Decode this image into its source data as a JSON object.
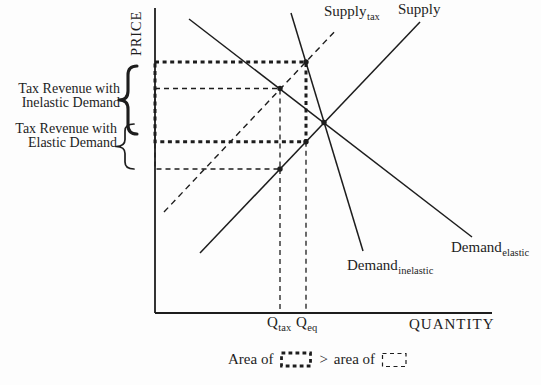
{
  "colors": {
    "ink": "#1d1d1d",
    "background": "#fdfdfd"
  },
  "labels": {
    "price_axis": "PRICE",
    "quantity_axis": "QUANTITY",
    "curves": {
      "supply_tax": {
        "base": "Supply",
        "sub": "tax"
      },
      "supply": {
        "base": "Supply",
        "sub": ""
      },
      "demand_inelastic": {
        "base": "Demand",
        "sub": "inelastic"
      },
      "demand_elastic": {
        "base": "Demand",
        "sub": "elastic"
      }
    },
    "x_ticks": {
      "q_tax": {
        "base": "Q",
        "sub": "tax"
      },
      "q_eq": {
        "base": "Q",
        "sub": "eq"
      }
    },
    "annotations": {
      "inelastic": {
        "line1": "Tax Revenue with",
        "line2": "Inelastic Demand"
      },
      "elastic": {
        "line1": "Tax Revenue with",
        "line2": "Elastic Demand"
      }
    },
    "legend": {
      "area_of": "Area of",
      "comparator": ">",
      "area_of_lower": "area of"
    }
  },
  "chart_data": {
    "type": "line",
    "xlabel": "QUANTITY",
    "ylabel": "PRICE",
    "x_ticks": [
      "Q_tax",
      "Q_eq"
    ],
    "grid": false,
    "legend_position": "bottom",
    "series": [
      {
        "id": "supply",
        "name": "Supply",
        "style": "solid",
        "sw": 1.5,
        "points_px": [
          [
            200,
            253
          ],
          [
            420,
            22
          ]
        ]
      },
      {
        "id": "supply-tax",
        "name": "Supply_tax",
        "style": "dashed",
        "dash": "6 4.5",
        "sw": 1.4,
        "points_px": [
          [
            164,
            212
          ],
          [
            337,
            29
          ]
        ]
      },
      {
        "id": "demand-inelastic",
        "name": "Demand_inelastic",
        "style": "solid",
        "sw": 1.5,
        "points_px": [
          [
            291,
            13
          ],
          [
            363,
            251
          ]
        ]
      },
      {
        "id": "demand-elastic",
        "name": "Demand_elastic",
        "style": "solid",
        "sw": 1.5,
        "points_px": [
          [
            189,
            19
          ],
          [
            472,
            237
          ]
        ]
      }
    ],
    "key_points_px": {
      "supply_tax_x_demand_inelastic": [
        306,
        62
      ],
      "supply_tax_x_demand_elastic": [
        280,
        88.5
      ],
      "equilibrium": [
        324,
        122.5
      ],
      "supply_at_q_inelastic": [
        306,
        141.7
      ],
      "supply_at_q_elastic": [
        280,
        169
      ]
    },
    "geometry": {
      "axis_width": 1.8,
      "dot_r": 2.7,
      "y_axis": {
        "x": 155,
        "y0": 8,
        "y1": 313
      },
      "x_axis": {
        "y": 313,
        "x0": 155,
        "x1": 492
      },
      "rects": [
        {
          "id": "tax-revenue-elastic-rect",
          "x": 155,
          "y": 88.5,
          "w": 125,
          "h": 80.5,
          "sw": 1.3,
          "dash": "5 4"
        },
        {
          "id": "tax-revenue-inelastic-rect",
          "x": 155,
          "y": 62,
          "w": 151,
          "h": 79.7,
          "sw": 3,
          "dash": "4 3.6"
        }
      ],
      "guides": [
        {
          "id": "q-tax-guide",
          "x1": 280,
          "y1": 169,
          "x2": 280,
          "y2": 312,
          "sw": 1.3,
          "dash": "5 4"
        },
        {
          "id": "q-eq-guide",
          "x1": 306,
          "y1": 141.7,
          "x2": 306,
          "y2": 312,
          "sw": 1.3,
          "dash": "5 4"
        }
      ],
      "braces": [
        {
          "id": "brace-inelastic",
          "xe": 137,
          "xs": 128,
          "xt": 119,
          "y0": 66,
          "y1": 134,
          "r": 9,
          "sw": 3.1
        },
        {
          "id": "brace-elastic",
          "xe": 134,
          "xs": 125,
          "xt": 116,
          "y0": 124,
          "y1": 169,
          "r": 7,
          "sw": 1.7
        }
      ]
    }
  }
}
